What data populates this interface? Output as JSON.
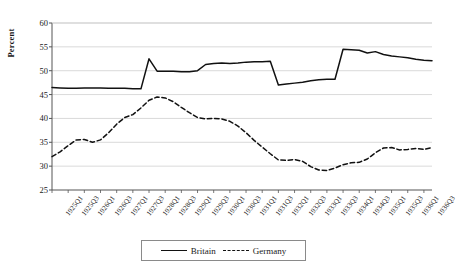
{
  "chart_data": {
    "type": "line",
    "title": "",
    "xlabel": "",
    "ylabel": "Percent",
    "ylim": [
      25,
      60
    ],
    "ytick_step": 5,
    "yticks": [
      25,
      30,
      35,
      40,
      45,
      50,
      55,
      60
    ],
    "grid": true,
    "legend_position": "bottom-center",
    "x": [
      "1925Q1",
      "1925Q2",
      "1925Q3",
      "1925Q4",
      "1926Q1",
      "1926Q2",
      "1926Q3",
      "1926Q4",
      "1927Q1",
      "1927Q2",
      "1927Q3",
      "1927Q4",
      "1928Q1",
      "1928Q2",
      "1928Q3",
      "1928Q4",
      "1929Q1",
      "1929Q2",
      "1929Q3",
      "1929Q4",
      "1930Q1",
      "1930Q2",
      "1930Q3",
      "1930Q4",
      "1931Q1",
      "1931Q2",
      "1931Q3",
      "1931Q4",
      "1932Q1",
      "1932Q2",
      "1932Q3",
      "1932Q4",
      "1933Q1",
      "1933Q2",
      "1933Q3",
      "1933Q4",
      "1934Q1",
      "1934Q2",
      "1934Q3",
      "1934Q4",
      "1935Q1",
      "1935Q2",
      "1935Q3",
      "1935Q4",
      "1936Q1",
      "1936Q2",
      "1936Q3",
      "1936Q4"
    ],
    "xtick_labels": [
      "1925Q1",
      "1925Q3",
      "1926Q1",
      "1926Q3",
      "1927Q1",
      "1927Q3",
      "1928Q1",
      "1928Q3",
      "1929Q1",
      "1929Q3",
      "1930Q1",
      "1930Q3",
      "1931Q1",
      "1931Q3",
      "1932Q1",
      "1932Q3",
      "1933Q1",
      "1933Q3",
      "1934Q1",
      "1934Q3",
      "1935Q1",
      "1935Q3",
      "1936Q1",
      "1936Q3"
    ],
    "series": [
      {
        "name": "Britain",
        "style": "solid",
        "color": "#111111",
        "values": [
          46.5,
          46.4,
          46.3,
          46.3,
          46.4,
          46.4,
          46.4,
          46.3,
          46.3,
          46.3,
          46.2,
          46.2,
          52.5,
          49.9,
          49.9,
          49.9,
          49.8,
          49.8,
          50.0,
          51.3,
          51.5,
          51.6,
          51.5,
          51.6,
          51.8,
          51.9,
          51.9,
          52.0,
          47.0,
          47.2,
          47.4,
          47.6,
          47.9,
          48.1,
          48.2,
          48.2,
          54.5,
          54.4,
          54.3,
          53.7,
          54.0,
          53.4,
          53.1,
          52.9,
          52.7,
          52.4,
          52.2,
          52.1
        ]
      },
      {
        "name": "Germany",
        "style": "dashed",
        "color": "#111111",
        "values": [
          32.0,
          33.0,
          34.3,
          35.5,
          35.6,
          35.0,
          35.5,
          37.0,
          38.8,
          40.2,
          40.8,
          42.2,
          43.8,
          44.5,
          44.3,
          43.5,
          42.3,
          41.2,
          40.2,
          39.9,
          40.0,
          39.9,
          39.4,
          38.4,
          37.0,
          35.4,
          34.0,
          32.6,
          31.3,
          31.2,
          31.4,
          31.0,
          29.9,
          29.2,
          29.1,
          29.6,
          30.3,
          30.7,
          30.8,
          31.5,
          32.8,
          33.8,
          33.9,
          33.4,
          33.5,
          33.7,
          33.5,
          33.9
        ]
      }
    ]
  },
  "legend": {
    "britain_label": "Britain",
    "germany_label": "Germany"
  },
  "axis": {
    "y_title": "Percent"
  }
}
